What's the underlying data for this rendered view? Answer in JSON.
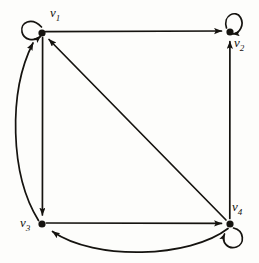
{
  "figure": {
    "type": "directed-graph-diagram",
    "background_color": "#fdfdfb",
    "ink_color": "#15130f",
    "width": 259,
    "height": 263
  },
  "vertices": [
    {
      "id": "v1",
      "label_text": "v",
      "label_sub": "1",
      "x": 42,
      "y": 33,
      "label_x": 50,
      "label_y": 6,
      "has_self_loop": true,
      "self_loop_direction": "upper-left"
    },
    {
      "id": "v2",
      "label_text": "v",
      "label_sub": "2",
      "x": 230,
      "y": 32,
      "label_x": 234,
      "label_y": 36,
      "has_self_loop": true,
      "self_loop_direction": "upper-right"
    },
    {
      "id": "v3",
      "label_text": "v",
      "label_sub": "3",
      "x": 42,
      "y": 224,
      "label_x": 20,
      "label_y": 216,
      "has_self_loop": false,
      "self_loop_direction": "none"
    },
    {
      "id": "v4",
      "label_text": "v",
      "label_sub": "4",
      "x": 230,
      "y": 224,
      "label_x": 232,
      "label_y": 200,
      "has_self_loop": true,
      "self_loop_direction": "lower-right"
    }
  ],
  "edges": [
    {
      "id": "e-v1-v2",
      "from": "v1",
      "to": "v2",
      "style": "straight",
      "description": "top horizontal edge from v1 to v2"
    },
    {
      "id": "e-v1-v3",
      "from": "v1",
      "to": "v3",
      "style": "straight",
      "description": "left vertical edge from v1 down to v3"
    },
    {
      "id": "e-v3-v1",
      "from": "v3",
      "to": "v1",
      "style": "curved-left",
      "description": "curved edge bulging left from v3 up to v1"
    },
    {
      "id": "e-v3-v4",
      "from": "v3",
      "to": "v4",
      "style": "straight",
      "description": "bottom horizontal edge from v3 to v4"
    },
    {
      "id": "e-v4-v3",
      "from": "v4",
      "to": "v3",
      "style": "curved-below",
      "description": "curved edge bulging downward from v4 back to v3"
    },
    {
      "id": "e-v4-v1",
      "from": "v4",
      "to": "v1",
      "style": "straight",
      "description": "diagonal edge from v4 up-left to v1"
    },
    {
      "id": "e-v4-v2",
      "from": "v4",
      "to": "v2",
      "style": "straight",
      "description": "right vertical edge from v4 up to v2"
    },
    {
      "id": "e-v1-v1",
      "from": "v1",
      "to": "v1",
      "style": "self-loop",
      "description": "self loop at v1"
    },
    {
      "id": "e-v2-v2",
      "from": "v2",
      "to": "v2",
      "style": "self-loop",
      "description": "self loop at v2"
    },
    {
      "id": "e-v4-v4",
      "from": "v4",
      "to": "v4",
      "style": "self-loop",
      "description": "self loop at v4"
    }
  ]
}
